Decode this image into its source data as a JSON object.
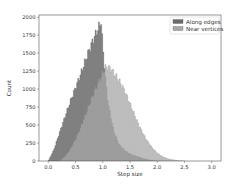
{
  "chart_data": {
    "type": "histogram",
    "title": "",
    "xlabel": "Step size",
    "ylabel": "Count",
    "xlim": [
      -0.17,
      3.17
    ],
    "ylim": [
      0,
      2030
    ],
    "x_ticks": [
      0.0,
      0.5,
      1.0,
      1.5,
      2.0,
      2.5,
      3.0
    ],
    "x_tick_labels": [
      "0.0",
      "0.5",
      "1.0",
      "1.5",
      "2.0",
      "2.5",
      "3.0"
    ],
    "y_ticks": [
      0,
      250,
      500,
      750,
      1000,
      1250,
      1500,
      1750,
      2000
    ],
    "y_tick_labels": [
      "0",
      "250",
      "500",
      "750",
      "1000",
      "1250",
      "1500",
      "1750",
      "2000"
    ],
    "grid": false,
    "legend_position": "upper right",
    "series": [
      {
        "name": "Along edges",
        "color": "#6b6b6b",
        "opacity": 0.85,
        "x": [
          0.0,
          0.1,
          0.2,
          0.3,
          0.4,
          0.5,
          0.6,
          0.7,
          0.8,
          0.9,
          0.95,
          0.97,
          1.0,
          1.05,
          1.1,
          1.2,
          1.3,
          1.4,
          1.5,
          1.6,
          1.7,
          1.8,
          1.9,
          2.0
        ],
        "values": [
          0,
          150,
          380,
          600,
          820,
          1020,
          1220,
          1440,
          1640,
          1820,
          1900,
          1950,
          1600,
          1150,
          800,
          420,
          230,
          150,
          100,
          70,
          45,
          25,
          10,
          0
        ]
      },
      {
        "name": "Near vertices",
        "color": "#a8a8a8",
        "opacity": 0.75,
        "x": [
          0.2,
          0.3,
          0.4,
          0.5,
          0.6,
          0.7,
          0.8,
          0.9,
          1.0,
          1.05,
          1.1,
          1.15,
          1.2,
          1.3,
          1.4,
          1.5,
          1.6,
          1.7,
          1.8,
          1.9,
          2.0,
          2.1,
          2.2,
          2.3,
          2.4,
          2.5
        ],
        "values": [
          0,
          60,
          160,
          300,
          480,
          680,
          880,
          1060,
          1230,
          1300,
          1310,
          1280,
          1230,
          1120,
          980,
          800,
          610,
          440,
          300,
          190,
          110,
          60,
          30,
          15,
          5,
          0
        ]
      }
    ]
  },
  "legend": {
    "items": [
      {
        "label": "Along edges",
        "color": "#6b6b6b"
      },
      {
        "label": "Near vertices",
        "color": "#a8a8a8"
      }
    ]
  },
  "axes": {
    "xlabel": "Step size",
    "ylabel": "Count"
  }
}
